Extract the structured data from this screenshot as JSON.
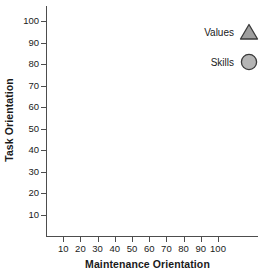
{
  "chart_data": {
    "type": "scatter",
    "title": "",
    "xlabel": "Maintenance Orientation",
    "ylabel": "Task Orientation",
    "xlim": [
      0,
      100
    ],
    "ylim": [
      0,
      100
    ],
    "xticks": [
      10,
      20,
      30,
      40,
      50,
      60,
      70,
      80,
      90,
      100
    ],
    "yticks": [
      10,
      20,
      30,
      40,
      50,
      60,
      70,
      80,
      90,
      100
    ],
    "xtick_labels": [
      "10",
      "20",
      "30",
      "40",
      "50",
      "60",
      "70",
      "80",
      "90",
      "100"
    ],
    "ytick_labels": [
      "10",
      "20",
      "30",
      "40",
      "50",
      "60",
      "70",
      "80",
      "90",
      "100"
    ],
    "grid": false,
    "legend_position": "top-right",
    "series": [
      {
        "name": "Values",
        "marker": "triangle",
        "marker_fill": "#9e9e9e",
        "marker_edge": "#3a3a3a",
        "x": [],
        "y": [],
        "values": []
      },
      {
        "name": "Skills",
        "marker": "circle",
        "marker_fill": "#b5b5b5",
        "marker_edge": "#3a3a3a",
        "x": [],
        "y": [],
        "values": []
      }
    ],
    "annotations": []
  },
  "axes": {
    "x_title": "Maintenance Orientation",
    "y_title": "Task Orientation",
    "x_ticks": [
      {
        "label": "10",
        "value": 10
      },
      {
        "label": "20",
        "value": 20
      },
      {
        "label": "30",
        "value": 30
      },
      {
        "label": "40",
        "value": 40
      },
      {
        "label": "50",
        "value": 50
      },
      {
        "label": "60",
        "value": 60
      },
      {
        "label": "70",
        "value": 70
      },
      {
        "label": "80",
        "value": 80
      },
      {
        "label": "90",
        "value": 90
      },
      {
        "label": "100",
        "value": 100
      }
    ],
    "y_ticks": [
      {
        "label": "10",
        "value": 10
      },
      {
        "label": "20",
        "value": 20
      },
      {
        "label": "30",
        "value": 30
      },
      {
        "label": "40",
        "value": 40
      },
      {
        "label": "50",
        "value": 50
      },
      {
        "label": "60",
        "value": 60
      },
      {
        "label": "70",
        "value": 70
      },
      {
        "label": "80",
        "value": 80
      },
      {
        "label": "90",
        "value": 90
      },
      {
        "label": "100",
        "value": 100
      }
    ]
  },
  "legend": {
    "entries": [
      {
        "label": "Values",
        "icon": "triangle-marker-icon"
      },
      {
        "label": "Skills",
        "icon": "circle-marker-icon"
      }
    ]
  },
  "colors": {
    "axis": "#4d4d4d",
    "text": "#1a1a1a",
    "marker_fill": "#a8a8a8",
    "marker_edge": "#3a3a3a",
    "background": "#ffffff"
  }
}
